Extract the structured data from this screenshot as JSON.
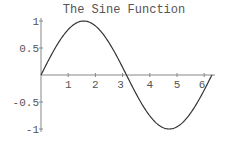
{
  "chart_data": {
    "type": "line",
    "title": "The Sine Function",
    "xlabel": "",
    "ylabel": "",
    "function": "sin(x)",
    "xlim": [
      0,
      6.2832
    ],
    "ylim": [
      -1,
      1
    ],
    "grid": false,
    "legend": null,
    "x_ticks": [
      1,
      2,
      3,
      4,
      5,
      6
    ],
    "x_tick_labels": [
      "1",
      "2",
      "3",
      "4",
      "5",
      "6"
    ],
    "y_ticks": [
      1,
      0.5,
      -0.5,
      -1
    ],
    "y_tick_labels": [
      "1",
      "0.5",
      "-0.5",
      "-1"
    ],
    "series": [
      {
        "name": "sin(x)",
        "color": "#333333",
        "x": [
          0,
          0.5,
          1,
          1.5708,
          2,
          2.5,
          3,
          3.1416,
          3.5,
          4,
          4.5,
          4.7124,
          5,
          5.5,
          6,
          6.2832
        ],
        "values": [
          0,
          0.479,
          0.841,
          1,
          0.909,
          0.598,
          0.141,
          0,
          -0.351,
          -0.757,
          -0.978,
          -1,
          -0.959,
          -0.706,
          -0.279,
          0
        ]
      }
    ]
  }
}
